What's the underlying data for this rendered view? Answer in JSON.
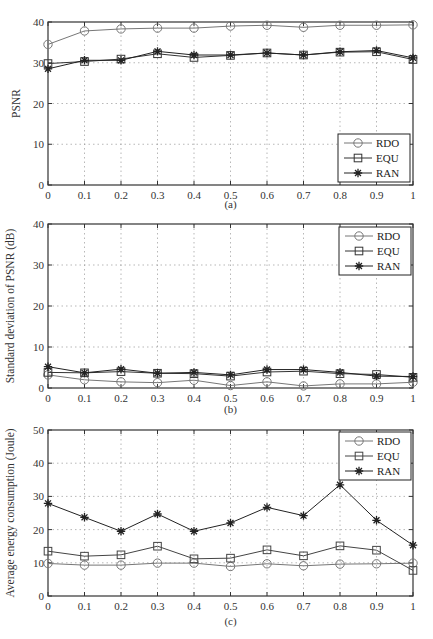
{
  "chart_data": [
    {
      "type": "line",
      "caption": "(a)",
      "title": "",
      "xlabel": "",
      "ylabel": "PSNR",
      "xlim": [
        0,
        1
      ],
      "ylim": [
        0,
        40
      ],
      "yticks": [
        0,
        10,
        20,
        30,
        40
      ],
      "xticks": [
        "0",
        "0.1",
        "0.2",
        "0.3",
        "0.4",
        "0.5",
        "0.6",
        "0.7",
        "0.8",
        "0.9",
        "1"
      ],
      "grid": true,
      "legend_position": "lower right",
      "x": [
        0,
        0.1,
        0.2,
        0.3,
        0.4,
        0.5,
        0.6,
        0.7,
        0.8,
        0.9,
        1
      ],
      "series": [
        {
          "name": "RDO",
          "marker": "circle",
          "color": "#777777",
          "values": [
            34.5,
            37.8,
            38.3,
            38.5,
            38.5,
            39.0,
            39.2,
            38.7,
            39.2,
            39.2,
            39.3
          ]
        },
        {
          "name": "EQU",
          "marker": "square",
          "color": "#333333",
          "values": [
            29.8,
            30.3,
            30.9,
            32.2,
            31.3,
            31.8,
            32.4,
            31.9,
            32.6,
            32.7,
            30.8
          ]
        },
        {
          "name": "RAN",
          "marker": "star",
          "color": "#222222",
          "values": [
            28.5,
            30.6,
            30.6,
            32.8,
            31.9,
            31.9,
            32.4,
            31.9,
            32.7,
            33.0,
            31.2
          ]
        }
      ]
    },
    {
      "type": "line",
      "caption": "(b)",
      "title": "",
      "xlabel": "",
      "ylabel": "Standard deviation of PSNR (dB)",
      "xlim": [
        0,
        1
      ],
      "ylim": [
        0,
        40
      ],
      "yticks": [
        0,
        10,
        20,
        30,
        40
      ],
      "xticks": [
        "0",
        "0.1",
        "0.2",
        "0.3",
        "0.4",
        "0.5",
        "0.6",
        "0.7",
        "0.8",
        "0.9",
        "1"
      ],
      "grid": true,
      "legend_position": "upper right",
      "x": [
        0,
        0.1,
        0.2,
        0.3,
        0.4,
        0.5,
        0.6,
        0.7,
        0.8,
        0.9,
        1
      ],
      "series": [
        {
          "name": "RDO",
          "marker": "circle",
          "color": "#777777",
          "values": [
            3.2,
            2.0,
            1.5,
            1.3,
            1.9,
            0.6,
            1.5,
            0.5,
            1.0,
            1.0,
            1.4
          ]
        },
        {
          "name": "EQU",
          "marker": "square",
          "color": "#333333",
          "values": [
            3.8,
            3.7,
            4.0,
            3.6,
            3.5,
            2.9,
            3.9,
            4.1,
            3.5,
            3.3,
            2.6
          ]
        },
        {
          "name": "RAN",
          "marker": "star",
          "color": "#222222",
          "values": [
            5.2,
            3.7,
            4.6,
            3.6,
            3.8,
            3.2,
            4.5,
            4.5,
            3.8,
            2.9,
            2.8
          ]
        }
      ]
    },
    {
      "type": "line",
      "caption": "(c)",
      "title": "",
      "xlabel": "",
      "ylabel": "Average energy consumption (Joule)",
      "xlim": [
        0,
        1
      ],
      "ylim": [
        0,
        50
      ],
      "yticks": [
        0,
        10,
        20,
        30,
        40,
        50
      ],
      "xticks": [
        "0",
        "0.1",
        "0.2",
        "0.3",
        "0.4",
        "0.5",
        "0.6",
        "0.7",
        "0.8",
        "0.9",
        "1"
      ],
      "grid": true,
      "legend_position": "upper right",
      "x": [
        0,
        0.1,
        0.2,
        0.3,
        0.4,
        0.5,
        0.6,
        0.7,
        0.8,
        0.9,
        1
      ],
      "series": [
        {
          "name": "RDO",
          "marker": "circle",
          "color": "#777777",
          "values": [
            9.8,
            9.3,
            9.3,
            9.9,
            9.9,
            8.9,
            9.7,
            9.1,
            9.6,
            9.7,
            9.9
          ]
        },
        {
          "name": "EQU",
          "marker": "square",
          "color": "#444444",
          "values": [
            13.5,
            12.0,
            12.4,
            15.0,
            11.2,
            11.4,
            13.9,
            12.1,
            15.1,
            13.8,
            7.7
          ]
        },
        {
          "name": "RAN",
          "marker": "star",
          "color": "#222222",
          "values": [
            27.9,
            23.7,
            19.5,
            24.7,
            19.5,
            22.0,
            26.7,
            24.2,
            33.5,
            22.8,
            15.3
          ]
        }
      ]
    }
  ]
}
